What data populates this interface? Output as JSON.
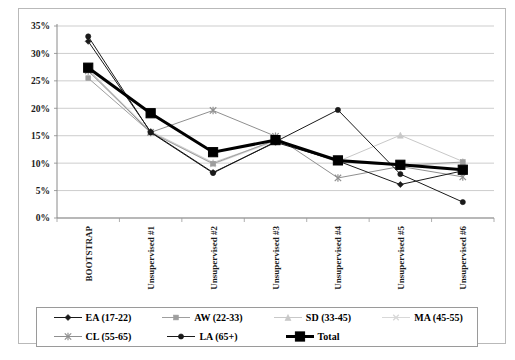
{
  "chart_data": {
    "type": "line",
    "title": "",
    "xlabel": "",
    "ylabel": "",
    "ylim": [
      0,
      35
    ],
    "ytick_step": 5,
    "ytick_labels": [
      "0%",
      "5%",
      "10%",
      "15%",
      "20%",
      "25%",
      "30%",
      "35%"
    ],
    "grid": true,
    "legend_position": "bottom",
    "categories": [
      "BOOTSTRAP",
      "Unsupervised #1",
      "Unsupervised #2",
      "Unsupervised #3",
      "Unsupervised #4",
      "Unsupervised #5",
      "Unsupervised #6"
    ],
    "series": [
      {
        "name": "EA (17-22)",
        "color": "#1a1a1a",
        "marker": "diamond",
        "width": 1,
        "values": [
          32.2,
          15.7,
          8.3,
          13.8,
          10.4,
          6.1,
          8.6
        ]
      },
      {
        "name": "AW (22-33)",
        "color": "#9e9e9e",
        "marker": "square",
        "width": 1,
        "values": [
          25.5,
          15.6,
          9.9,
          14.2,
          10.2,
          9.6,
          10.2
        ]
      },
      {
        "name": "SD (33-45)",
        "color": "#c8c8c8",
        "marker": "triangle",
        "width": 1,
        "values": [
          27.1,
          15.8,
          10.1,
          14.1,
          10.3,
          15.1,
          10.3
        ]
      },
      {
        "name": "MA (45-55)",
        "color": "#d8d8d8",
        "marker": "cross",
        "width": 1,
        "values": [
          26.9,
          15.7,
          9.8,
          14.0,
          10.2,
          9.7,
          9.9
        ]
      },
      {
        "name": "CL (55-65)",
        "color": "#8f8f8f",
        "marker": "star",
        "width": 1,
        "values": [
          26.8,
          15.6,
          19.6,
          14.9,
          7.3,
          9.4,
          7.5
        ]
      },
      {
        "name": "LA (65+)",
        "color": "#1a1a1a",
        "marker": "circle",
        "width": 1,
        "values": [
          33.1,
          15.6,
          8.2,
          13.9,
          19.7,
          8.0,
          2.9
        ]
      },
      {
        "name": "Total",
        "color": "#000000",
        "marker": "bigsquare",
        "width": 3,
        "values": [
          27.4,
          19.1,
          12.0,
          14.2,
          10.5,
          9.7,
          8.8
        ]
      }
    ]
  },
  "legend": {
    "entries": [
      {
        "label": "EA (17-22)"
      },
      {
        "label": "AW (22-33)"
      },
      {
        "label": "SD (33-45)"
      },
      {
        "label": "MA (45-55)"
      },
      {
        "label": "CL (55-65)"
      },
      {
        "label": "LA (65+)"
      },
      {
        "label": "Total"
      }
    ]
  }
}
